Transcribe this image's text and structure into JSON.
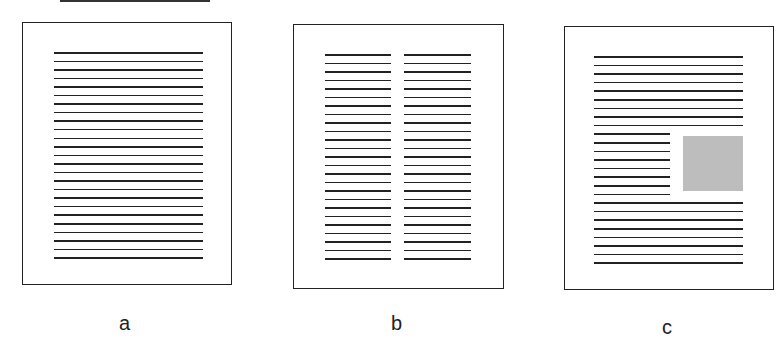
{
  "labels": {
    "a": "a",
    "b": "b",
    "c": "c"
  },
  "pages": [
    {
      "id": "a",
      "layout": "single-column",
      "line_count": 25
    },
    {
      "id": "b",
      "layout": "two-column",
      "line_count_per_column": 25
    },
    {
      "id": "c",
      "layout": "single-column-with-inset-figure",
      "full_lines_top": 9,
      "short_lines": 8,
      "full_lines_bottom": 8,
      "figure_color": "#bdbdbd"
    }
  ],
  "colors": {
    "ink": "#222222",
    "figure": "#bdbdbd",
    "background": "#ffffff"
  }
}
